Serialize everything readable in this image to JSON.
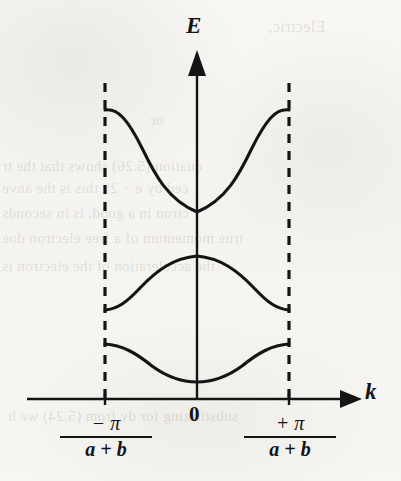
{
  "figure": {
    "background_color": "#f6f5f2",
    "ink_color": "#141414"
  },
  "axes": {
    "y_label": "E",
    "x_label": "k",
    "origin_label": "0",
    "y_axis_name": "energy-axis",
    "x_axis_name": "wavevector-axis"
  },
  "ticks": {
    "left": {
      "numerator": "− π",
      "denominator": "a + b"
    },
    "right": {
      "numerator": "+ π",
      "denominator": "a + b"
    }
  },
  "boundaries": {
    "style": "dashed",
    "left_label": "brillouin-zone-left-boundary",
    "right_label": "brillouin-zone-right-boundary"
  },
  "bleed_text": [
    {
      "text": "Electric,",
      "x": 268,
      "y": 18,
      "size": 16
    },
    {
      "text": "or",
      "x": 150,
      "y": 112,
      "size": 15
    },
    {
      "text": "quation (5.26) shows that the tr",
      "x": 2,
      "y": 158,
      "size": 15
    },
    {
      "text": "ced by e − 2π this is the anve",
      "x": 2,
      "y": 180,
      "size": 15
    },
    {
      "text": "ctron in a good, is in seconds",
      "x": 2,
      "y": 205,
      "size": 15
    },
    {
      "text": "true momentum of a free electron doe",
      "x": 2,
      "y": 230,
      "size": 15
    },
    {
      "text": "the acceleration of the electron is",
      "x": 2,
      "y": 258,
      "size": 15
    },
    {
      "text": "substituting for dv from (5.24) we h",
      "x": 8,
      "y": 408,
      "size": 15
    }
  ],
  "chart_data": {
    "type": "line",
    "xlabel": "k",
    "ylabel": "E",
    "xlim": [
      -1,
      1
    ],
    "ylim": [
      0,
      1
    ],
    "grid": false,
    "legend": false,
    "x_tick_labels": [
      "-π/(a+b)",
      "0",
      "+π/(a+b)"
    ],
    "x_tick_values": [
      -1,
      0,
      1
    ],
    "annotations": [
      "dashed vertical lines at k = ±π/(a+b) mark the Brillouin zone boundary",
      "energy gaps appear at the zone boundaries"
    ],
    "series": [
      {
        "name": "band-3-upper",
        "shape": "parabolic minimum at k=0",
        "x": [
          -1,
          -0.75,
          -0.5,
          -0.25,
          0,
          0.25,
          0.5,
          0.75,
          1
        ],
        "y": [
          0.94,
          0.86,
          0.73,
          0.63,
          0.59,
          0.63,
          0.73,
          0.86,
          0.94
        ]
      },
      {
        "name": "band-2-middle",
        "shape": "cosine maximum at k=0",
        "x": [
          -1,
          -0.75,
          -0.5,
          -0.25,
          0,
          0.25,
          0.5,
          0.75,
          1
        ],
        "y": [
          0.27,
          0.32,
          0.41,
          0.47,
          0.49,
          0.47,
          0.41,
          0.32,
          0.27
        ]
      },
      {
        "name": "band-1-lower",
        "shape": "shallow minimum at k=0",
        "x": [
          -1,
          -0.75,
          -0.5,
          -0.25,
          0,
          0.25,
          0.5,
          0.75,
          1
        ],
        "y": [
          0.175,
          0.16,
          0.12,
          0.095,
          0.09,
          0.095,
          0.12,
          0.16,
          0.175
        ]
      }
    ]
  }
}
